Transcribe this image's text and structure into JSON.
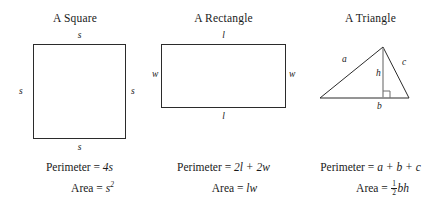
{
  "figures": [
    {
      "id": "square",
      "title": "A Square",
      "labels": {
        "top": "s",
        "bottom": "s",
        "left": "s",
        "right": "s"
      },
      "perimeter_label": "Perimeter = ",
      "perimeter_value": "4s",
      "area_label": "Area = ",
      "area_base": "s",
      "area_exponent": "2"
    },
    {
      "id": "rectangle",
      "title": "A Rectangle",
      "labels": {
        "top": "l",
        "bottom": "l",
        "left": "w",
        "right": "w"
      },
      "perimeter_label": "Perimeter = ",
      "perimeter_value": "2l + 2w",
      "area_label": "Area = ",
      "area_value": "lw"
    },
    {
      "id": "triangle",
      "title": "A Triangle",
      "labels": {
        "side_a": "a",
        "side_c": "c",
        "base": "b",
        "height": "h"
      },
      "perimeter_label": "Perimeter = ",
      "perimeter_value": "a + b + c",
      "area_label": "Area = ",
      "area_fraction_numerator": "1",
      "area_fraction_denominator": "2",
      "area_value": "bh"
    }
  ],
  "colors": {
    "outline": "#2b2b2b",
    "height_line": "#8d8d8d",
    "background": "#ffffff",
    "text": "#1a1a1a"
  }
}
